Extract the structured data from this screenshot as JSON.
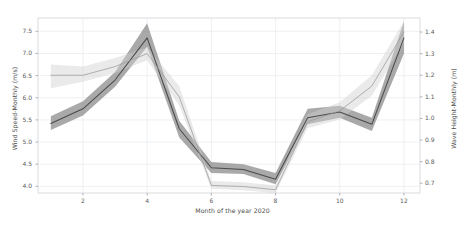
{
  "chart_data": {
    "type": "line",
    "title": "",
    "subtitle": "",
    "xlabel": "Month of the year 2020",
    "ylabel": "Wind Speed-Monthly (m/s)",
    "ylabel_right": "Wave Height-Monthly (m)",
    "grid": true,
    "legend": "none",
    "x": [
      1,
      2,
      3,
      4,
      5,
      6,
      7,
      8,
      9,
      10,
      11,
      12
    ],
    "xtick_labels": [
      "2",
      "4",
      "6",
      "8",
      "10",
      "12"
    ],
    "xtick_values": [
      2,
      4,
      6,
      8,
      10,
      12
    ],
    "xlim": [
      0.6,
      12.5
    ],
    "ylim": [
      3.85,
      7.8
    ],
    "ytick_labels": [
      "4.0",
      "4.5",
      "5.0",
      "5.5",
      "6.0",
      "6.5",
      "7.0",
      "7.5"
    ],
    "ytick_values": [
      4.0,
      4.5,
      5.0,
      5.5,
      6.0,
      6.5,
      7.0,
      7.5
    ],
    "ylim_right": [
      0.655,
      1.465
    ],
    "ytick_labels_right": [
      "0.7",
      "0.8",
      "0.9",
      "1.0",
      "1.1",
      "1.2",
      "1.3",
      "1.4"
    ],
    "ytick_values_right": [
      0.7,
      0.8,
      0.9,
      1.0,
      1.1,
      1.2,
      1.3,
      1.4
    ],
    "series": [
      {
        "name": "Wind Speed-Monthly (m/s)",
        "axis": "left",
        "color": "#4a4a4a",
        "band_color": "#8c8c8c",
        "values": [
          5.42,
          5.75,
          6.4,
          7.35,
          5.3,
          4.42,
          4.38,
          4.16,
          5.55,
          5.68,
          5.4,
          7.35
        ],
        "band_low": [
          5.27,
          5.6,
          6.25,
          7.15,
          5.1,
          4.3,
          4.28,
          4.05,
          5.4,
          5.55,
          5.25,
          7.0
        ],
        "band_high": [
          5.58,
          5.92,
          6.58,
          7.68,
          5.48,
          4.55,
          4.5,
          4.3,
          5.75,
          5.82,
          5.55,
          7.72
        ]
      },
      {
        "name": "Wave Height-Monthly (m)",
        "axis": "right",
        "color": "#9a9a9a",
        "band_color": "#d0d0d0",
        "values": [
          1.2,
          1.2,
          1.24,
          1.3,
          1.1,
          0.69,
          0.685,
          0.67,
          0.985,
          1.035,
          1.15,
          1.4
        ],
        "band_low": [
          1.14,
          1.17,
          1.21,
          1.27,
          1.06,
          0.675,
          0.668,
          0.655,
          0.955,
          0.995,
          1.105,
          1.35
        ],
        "band_high": [
          1.25,
          1.24,
          1.28,
          1.33,
          1.15,
          0.71,
          0.705,
          0.69,
          1.02,
          1.075,
          1.2,
          1.45
        ]
      }
    ]
  },
  "axes": {
    "xlabel": "Month of the year 2020",
    "ylabel_left": "Wind Speed-Monthly (m/s)",
    "ylabel_right": "Wave Height-Monthly (m)"
  },
  "ticks": {
    "left": [
      "7.5",
      "7.0",
      "6.5",
      "6.0",
      "5.5",
      "5.0",
      "4.5",
      "4.0"
    ],
    "right": [
      "1.4",
      "1.3",
      "1.2",
      "1.1",
      "1.0",
      "0.9",
      "0.8",
      "0.7"
    ],
    "bottom": [
      "2",
      "4",
      "6",
      "8",
      "10",
      "12"
    ]
  },
  "colors": {
    "line_dark": "#4a4a4a",
    "band_dark": "#8c8c8c",
    "line_light": "#9a9a9a",
    "band_light": "#d0d0d0",
    "grid": "#eaecef",
    "frame": "#d6d8dc",
    "background": "#ffffff",
    "text": "#4d4d4d"
  }
}
